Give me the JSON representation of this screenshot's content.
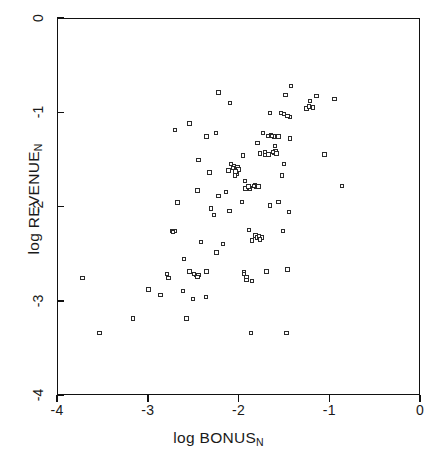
{
  "chart_data": {
    "type": "scatter",
    "title": "",
    "xlabel": "log BONUS",
    "xlabel_sub": "N",
    "ylabel": "log REVENUE",
    "ylabel_sub": "N",
    "xlim": [
      -4,
      0
    ],
    "ylim": [
      -4,
      0
    ],
    "xticks": [
      -4,
      -3,
      -2,
      -1,
      0
    ],
    "xticklabels": [
      "-4",
      "-3",
      "-2",
      "-1",
      "0"
    ],
    "yticks": [
      -4,
      -3,
      -2,
      -1,
      0
    ],
    "yticklabels": [
      "-4",
      "-3",
      "-2",
      "-1",
      "0"
    ],
    "grid": false,
    "legend": null,
    "marker": "open-square",
    "marker_color": "#2b2b2b",
    "n_points": 112,
    "points": [
      [
        -2.21,
        -0.8
      ],
      [
        -1.41,
        -0.73
      ],
      [
        -1.47,
        -0.83
      ],
      [
        -1.13,
        -0.84
      ],
      [
        -1.2,
        -0.89
      ],
      [
        -0.93,
        -0.87
      ],
      [
        -2.08,
        -0.91
      ],
      [
        -1.17,
        -0.96
      ],
      [
        -1.24,
        -0.97
      ],
      [
        -1.64,
        -1.02
      ],
      [
        -1.52,
        -1.02
      ],
      [
        -1.42,
        -1.06
      ],
      [
        -2.53,
        -1.13
      ],
      [
        -2.69,
        -1.2
      ],
      [
        -1.72,
        -1.23
      ],
      [
        -1.66,
        -1.26
      ],
      [
        -1.63,
        -1.25
      ],
      [
        -1.6,
        -1.27
      ],
      [
        -2.24,
        -1.23
      ],
      [
        -2.34,
        -1.27
      ],
      [
        -1.42,
        -1.29
      ],
      [
        -1.78,
        -1.34
      ],
      [
        -1.59,
        -1.37
      ],
      [
        -1.58,
        -1.42
      ],
      [
        -1.6,
        -1.44
      ],
      [
        -1.75,
        -1.45
      ],
      [
        -1.7,
        -1.46
      ],
      [
        -1.04,
        -1.46
      ],
      [
        -1.94,
        -1.47
      ],
      [
        -2.43,
        -1.52
      ],
      [
        -2.07,
        -1.56
      ],
      [
        -2.04,
        -1.58
      ],
      [
        -2.0,
        -1.59
      ],
      [
        -1.49,
        -1.56
      ],
      [
        -1.99,
        -1.62
      ],
      [
        -2.31,
        -1.65
      ],
      [
        -2.01,
        -1.66
      ],
      [
        -1.51,
        -1.68
      ],
      [
        -1.92,
        -1.74
      ],
      [
        -1.81,
        -1.78
      ],
      [
        -0.85,
        -1.79
      ],
      [
        -1.79,
        -1.8
      ],
      [
        -1.77,
        -1.8
      ],
      [
        -1.86,
        -1.82
      ],
      [
        -1.91,
        -1.82
      ],
      [
        -2.44,
        -1.84
      ],
      [
        -2.13,
        -1.86
      ],
      [
        -2.21,
        -1.9
      ],
      [
        -2.66,
        -1.97
      ],
      [
        -1.95,
        -1.96
      ],
      [
        -1.55,
        -1.96
      ],
      [
        -1.64,
        -2.0
      ],
      [
        -2.29,
        -2.03
      ],
      [
        -2.09,
        -2.06
      ],
      [
        -1.43,
        -2.07
      ],
      [
        -2.26,
        -2.1
      ],
      [
        -2.72,
        -2.27
      ],
      [
        -2.69,
        -2.27
      ],
      [
        -1.87,
        -2.26
      ],
      [
        -1.5,
        -2.27
      ],
      [
        -1.8,
        -2.32
      ],
      [
        -1.78,
        -2.34
      ],
      [
        -1.73,
        -2.34
      ],
      [
        -1.84,
        -2.37
      ],
      [
        -2.4,
        -2.39
      ],
      [
        -2.16,
        -2.41
      ],
      [
        -2.23,
        -2.5
      ],
      [
        -2.59,
        -2.57
      ],
      [
        -1.45,
        -2.68
      ],
      [
        -2.78,
        -2.73
      ],
      [
        -2.53,
        -2.7
      ],
      [
        -2.34,
        -2.7
      ],
      [
        -1.93,
        -2.71
      ],
      [
        -1.68,
        -2.7
      ],
      [
        -2.46,
        -2.74
      ],
      [
        -2.43,
        -2.74
      ],
      [
        -3.71,
        -2.77
      ],
      [
        -2.76,
        -2.77
      ],
      [
        -1.9,
        -2.76
      ],
      [
        -1.84,
        -2.8
      ],
      [
        -2.98,
        -2.89
      ],
      [
        -2.6,
        -2.91
      ],
      [
        -2.85,
        -2.95
      ],
      [
        -2.49,
        -2.99
      ],
      [
        -2.35,
        -2.97
      ],
      [
        -3.15,
        -3.2
      ],
      [
        -2.56,
        -3.2
      ],
      [
        -3.52,
        -3.35
      ],
      [
        -1.85,
        -3.35
      ],
      [
        -1.46,
        -3.35
      ],
      [
        -2.1,
        -1.63
      ],
      [
        -2.03,
        -1.68
      ],
      [
        -1.7,
        -1.43
      ],
      [
        -1.62,
        -1.26
      ],
      [
        -1.57,
        -1.45
      ],
      [
        -1.66,
        -1.46
      ],
      [
        -1.55,
        -1.27
      ],
      [
        -1.82,
        -1.79
      ],
      [
        -1.88,
        -1.8
      ],
      [
        -1.76,
        -2.33
      ],
      [
        -1.75,
        -2.36
      ],
      [
        -2.71,
        -2.28
      ],
      [
        -1.93,
        -2.73
      ],
      [
        -1.9,
        -2.79
      ],
      [
        -2.44,
        -2.76
      ],
      [
        -2.48,
        -2.73
      ],
      [
        -2.05,
        -1.6
      ],
      [
        -1.61,
        -1.43
      ],
      [
        -1.45,
        -1.05
      ],
      [
        -1.21,
        -0.95
      ],
      [
        -1.49,
        -1.03
      ],
      [
        -2.02,
        -1.64
      ]
    ]
  }
}
